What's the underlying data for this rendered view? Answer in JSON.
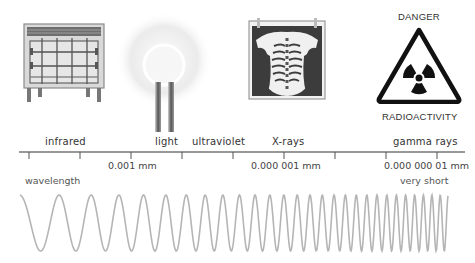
{
  "diagram": {
    "illustrations": [
      {
        "name": "electric-heater",
        "represents": "infrared"
      },
      {
        "name": "light-bulb-glow",
        "represents": "light"
      },
      {
        "name": "chest-x-ray",
        "represents": "X-rays"
      },
      {
        "name": "radiation-warning-sign",
        "represents": "gamma rays"
      }
    ],
    "sign": {
      "top_text": "DANGER",
      "bottom_text": "RADIOACTIVITY"
    },
    "bands": [
      {
        "label": "infrared"
      },
      {
        "label": "light"
      },
      {
        "label": "ultraviolet"
      },
      {
        "label": "X-rays"
      },
      {
        "label": "gamma rays"
      }
    ],
    "axis": {
      "tick_count": 9,
      "tick_labels": [
        {
          "label": "0.001 mm"
        },
        {
          "label": "0.000 001 mm"
        },
        {
          "label": "0.000 000 01 mm"
        }
      ],
      "left_caption": "wavelength",
      "right_caption": "very short"
    },
    "wave": {
      "color": "#b5b5b5",
      "description": "sine wave with wavelength decreasing from left to right"
    }
  }
}
